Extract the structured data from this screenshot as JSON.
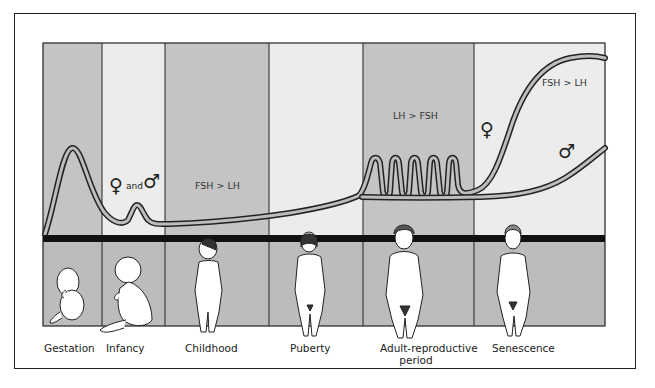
{
  "diagram": {
    "title": "",
    "colors": {
      "dark_band": "#c4c4c4",
      "light_band": "#ececec",
      "divider_bar": "#111111",
      "curve_fill": "#bdbdbd",
      "curve_stroke": "#222222"
    },
    "stages": [
      {
        "id": "gestation",
        "label": "Gestation",
        "shade": "dark",
        "x_start": 43,
        "x_end": 102,
        "figure": "fetus"
      },
      {
        "id": "infancy",
        "label": "Infancy",
        "shade": "light",
        "x_start": 102,
        "x_end": 165,
        "figure": "seated-infant"
      },
      {
        "id": "childhood",
        "label": "Childhood",
        "shade": "dark",
        "x_start": 165,
        "x_end": 269,
        "figure": "standing-child"
      },
      {
        "id": "puberty",
        "label": "Puberty",
        "shade": "light",
        "x_start": 269,
        "x_end": 363,
        "figure": "pubertal-girl"
      },
      {
        "id": "adult",
        "label": "Adult-reproductive",
        "label_line2": "period",
        "shade": "dark",
        "x_start": 363,
        "x_end": 474,
        "figure": "adult-woman"
      },
      {
        "id": "senescence",
        "label": "Senescence",
        "shade": "light",
        "x_start": 474,
        "x_end": 605,
        "figure": "older-woman"
      }
    ],
    "annotations": {
      "infancy_sex": {
        "female_symbol": "♀",
        "and_text": "and",
        "male_symbol": "♂"
      },
      "childhood_ratio": "FSH > LH",
      "adult_ratio": "LH > FSH",
      "senescence_ratio": "FSH > LH",
      "senescence_female_symbol": "♀",
      "senescence_male_symbol": "♂"
    },
    "curves": [
      {
        "name": "gonadotropin-level-shared",
        "description": "Fetal peak in gestation, small peak in infancy, low in childhood, rising at puberty"
      },
      {
        "name": "female-gonadotropin",
        "description": "Cyclic pulses during adult-reproductive period, sharp rise in senescence"
      },
      {
        "name": "male-gonadotropin",
        "description": "Steady through adulthood, gradual rise in senescence"
      }
    ]
  }
}
